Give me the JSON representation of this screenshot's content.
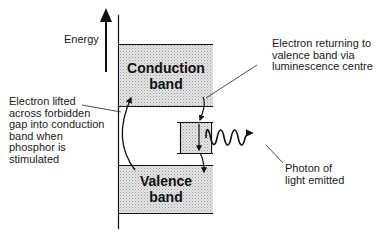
{
  "axis": {
    "label": "Energy"
  },
  "bands": {
    "conduction": {
      "line1": "Conduction",
      "line2": "band"
    },
    "valence": {
      "line1": "Valence",
      "line2": "band"
    }
  },
  "annotations": {
    "lifted": {
      "lines": [
        "Electron lifted",
        "across forbidden",
        "gap into conduction",
        "band when",
        "phosphor is",
        "stimulated"
      ]
    },
    "returning": {
      "lines": [
        "Electron returning to",
        "valence band via",
        "luminescence centre"
      ]
    },
    "photon": {
      "lines": [
        "Photon of",
        "light emitted"
      ]
    }
  },
  "colors": {
    "band_fill": "#d9d9d9",
    "line": "#111111"
  }
}
